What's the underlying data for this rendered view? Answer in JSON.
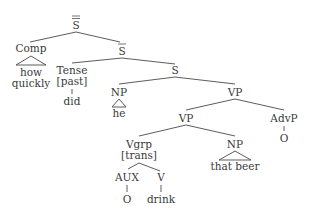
{
  "tree": {
    "nodes": {
      "root": {
        "label": "S"
      },
      "comp": {
        "label": "Comp"
      },
      "comp_words": [
        "how",
        "quickly"
      ],
      "sbar": {
        "label": "S"
      },
      "tense": {
        "label": "Tense",
        "feature": "[past]",
        "word": "did"
      },
      "s": {
        "label": "S"
      },
      "np1": {
        "label": "NP",
        "word": "he"
      },
      "vp_top": {
        "label": "VP"
      },
      "vp_inner": {
        "label": "VP"
      },
      "advp": {
        "label": "AdvP",
        "word": "O"
      },
      "vgrp": {
        "label": "Vgrp",
        "feature": "[trans]"
      },
      "np2": {
        "label": "NP",
        "word": "that beer"
      },
      "aux": {
        "label": "AUX",
        "word": "O"
      },
      "v": {
        "label": "V",
        "word": "drink"
      }
    }
  }
}
